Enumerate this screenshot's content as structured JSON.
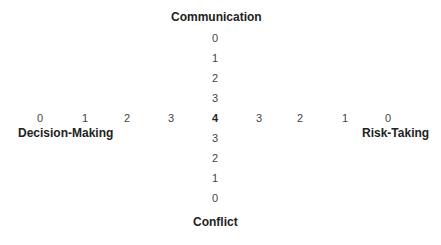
{
  "axes": {
    "top": "Communication",
    "bottom": "Conflict",
    "left": "Decision-Making",
    "right": "Risk-Taking"
  },
  "center_value": "4",
  "vertical_top_scale": [
    "0",
    "1",
    "2",
    "3"
  ],
  "vertical_bottom_scale": [
    "3",
    "2",
    "1",
    "0"
  ],
  "horizontal_left_scale": [
    "0",
    "1",
    "2",
    "3"
  ],
  "horizontal_right_scale": [
    "3",
    "2",
    "1",
    "0"
  ]
}
